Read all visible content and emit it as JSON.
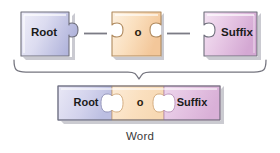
{
  "figure": {
    "caption": "Word",
    "top_row": {
      "pieces": [
        {
          "label": "Root",
          "color": "#c3c6e6",
          "icon": "puzzle-piece-tab-right"
        },
        {
          "label": "o",
          "color": "#fbdfba",
          "icon": "puzzle-piece-blank-both"
        },
        {
          "label": "Suffix",
          "color": "#e3bfe0",
          "icon": "puzzle-piece-blank-left"
        }
      ],
      "connectors": [
        "connector-line",
        "connector-line"
      ]
    },
    "brace": {
      "icon": "curly-brace-down",
      "color": "#6e6e78"
    },
    "assembled": {
      "segments": [
        {
          "label": "Root",
          "color": "#c3c6e6"
        },
        {
          "label": "o",
          "color": "#fbdfba"
        },
        {
          "label": "Suffix",
          "color": "#e3bfe0"
        }
      ]
    }
  },
  "colors": {
    "root_light": "#eceaf7",
    "root_dark": "#b5b8dd",
    "o_light": "#fdf0de",
    "o_dark": "#f6cfa3",
    "suffix_light": "#f3e0f2",
    "suffix_dark": "#d8aed6",
    "outline": "#6f6f7c",
    "shadow": "#9a9aa6",
    "connector": "#7b7b85",
    "caption": "#3a3a3a"
  }
}
